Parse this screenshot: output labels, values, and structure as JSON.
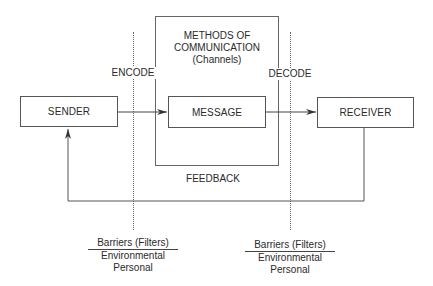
{
  "diagram": {
    "nodes": {
      "sender": "SENDER",
      "message": "MESSAGE",
      "receiver": "RECEIVER"
    },
    "channel": {
      "line1": "METHODS OF",
      "line2": "COMMUNICATION",
      "line3": "(Channels)"
    },
    "labels": {
      "encode": "ENCODE",
      "decode": "DECODE",
      "feedback": "FEEDBACK"
    },
    "barriers": [
      {
        "title": "Barriers (Filters)",
        "items": [
          "Environmental",
          "Personal"
        ]
      },
      {
        "title": "Barriers (Filters)",
        "items": [
          "Environmental",
          "Personal"
        ]
      }
    ],
    "edges": [
      {
        "from": "sender",
        "to": "message",
        "label": "ENCODE"
      },
      {
        "from": "message",
        "to": "receiver",
        "label": "DECODE"
      },
      {
        "from": "receiver",
        "to": "sender",
        "label": "FEEDBACK"
      }
    ]
  }
}
